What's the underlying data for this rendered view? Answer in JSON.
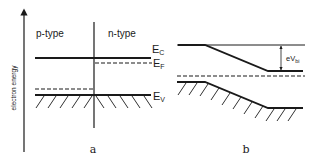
{
  "figure": {
    "y_axis_label": "electron energy",
    "panel_a": {
      "caption": "a",
      "region_left": "p-type",
      "region_right": "n-type",
      "levels": {
        "ec": {
          "main": "E",
          "sub": "C"
        },
        "ef": {
          "main": "E",
          "sub": "F"
        },
        "ev": {
          "main": "E",
          "sub": "V"
        }
      }
    },
    "panel_b": {
      "caption": "b",
      "barrier": {
        "main": "eV",
        "sub": "bi"
      }
    },
    "colors": {
      "line": "#1a1a1a",
      "background": "#ffffff"
    }
  }
}
